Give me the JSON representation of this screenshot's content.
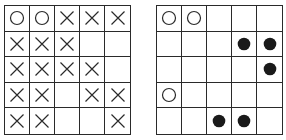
{
  "diagram": {
    "colors": {
      "line": "#2a2a2a",
      "background": "#ffffff",
      "filled_dot": "#1a1a1a"
    },
    "legend_symbols": {
      "O": "open-circle",
      "X": "cross",
      "B": "filled-dot",
      "": "empty"
    },
    "left_grid": {
      "rows": [
        [
          "O",
          "O",
          "X",
          "X",
          "X"
        ],
        [
          "X",
          "X",
          "X",
          "",
          ""
        ],
        [
          "X",
          "X",
          "X",
          "X",
          ""
        ],
        [
          "X",
          "X",
          "",
          "X",
          "X"
        ],
        [
          "X",
          "X",
          "",
          "",
          "X"
        ]
      ]
    },
    "right_grid": {
      "rows": [
        [
          "O",
          "O",
          "",
          "",
          ""
        ],
        [
          "",
          "",
          "",
          "B",
          "B"
        ],
        [
          "",
          "",
          "",
          "",
          "B"
        ],
        [
          "O",
          "",
          "",
          "",
          ""
        ],
        [
          "",
          "",
          "B",
          "B",
          ""
        ]
      ]
    }
  }
}
